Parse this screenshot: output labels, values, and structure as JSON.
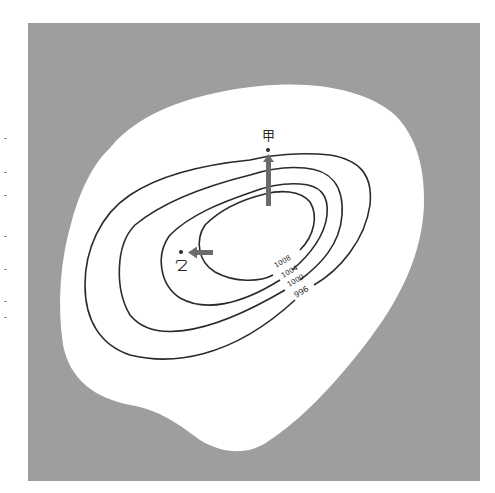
{
  "figure": {
    "type": "isobar-map",
    "background_color": "#9e9e9e",
    "land_color": "#ffffff",
    "line_color": "#2a2a2a",
    "arrow_color": "#6b6b6b"
  },
  "isobars": [
    {
      "label": "1008",
      "unit": "hPa"
    },
    {
      "label": "1004",
      "unit": "hPa"
    },
    {
      "label": "1000",
      "unit": "hPa"
    },
    {
      "label": "996",
      "unit": "hPa"
    }
  ],
  "points": [
    {
      "id": "jia",
      "label": "甲",
      "arrow_direction": "north"
    },
    {
      "id": "yi",
      "label": "乙",
      "arrow_direction": "west"
    }
  ]
}
